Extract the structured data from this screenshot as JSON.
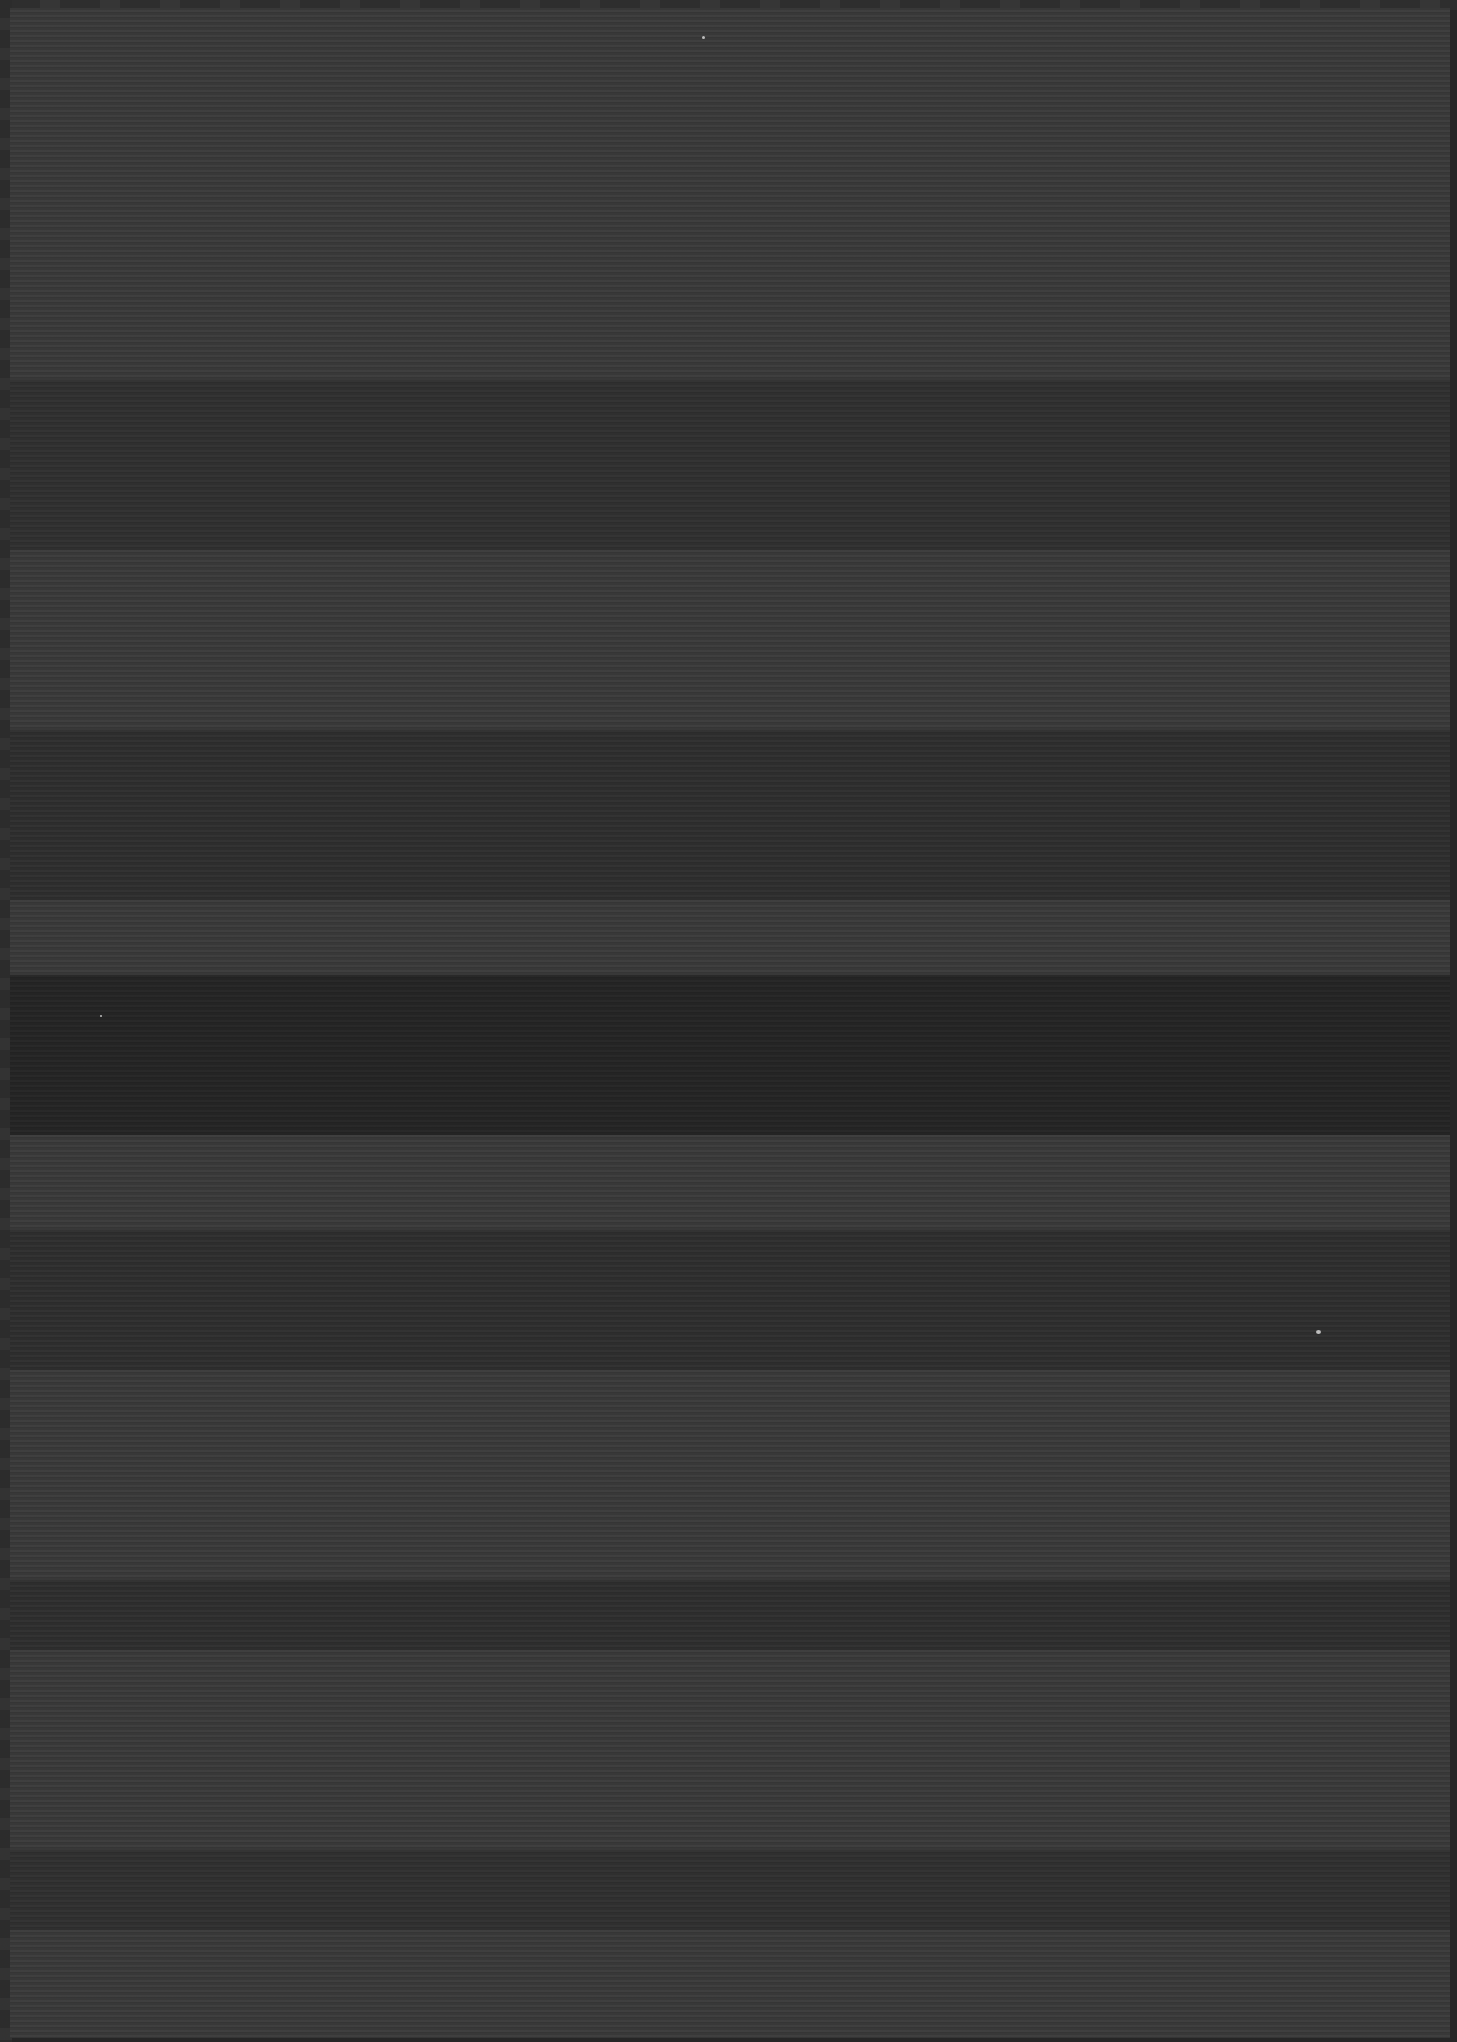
{
  "image": {
    "description": "Dark, noisy scanned paper texture with horizontal banding; no legible text",
    "colors": {
      "background": "#262626",
      "page": "#3b3b3b",
      "dark_band": "#2b2b2b",
      "darkest_band": "#242424",
      "speck": "#bdbdbd"
    },
    "bands": [
      {
        "top": 380,
        "height": 170,
        "shade": "#333333"
      },
      {
        "top": 730,
        "height": 170,
        "shade": "#313131"
      },
      {
        "top": 975,
        "height": 160,
        "shade": "#262626"
      },
      {
        "top": 1230,
        "height": 140,
        "shade": "#303030"
      },
      {
        "top": 1580,
        "height": 70,
        "shade": "#303030"
      },
      {
        "top": 1850,
        "height": 80,
        "shade": "#313131"
      }
    ]
  }
}
